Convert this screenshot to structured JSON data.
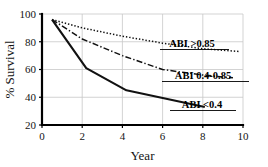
{
  "chart_data": {
    "type": "line",
    "title": "",
    "xlabel": "Year",
    "ylabel": "% Survival",
    "xlim": [
      0,
      10
    ],
    "ylim": [
      20,
      100
    ],
    "xticks": [
      0,
      2,
      4,
      6,
      8,
      10
    ],
    "yticks": [
      20,
      40,
      60,
      80,
      100
    ],
    "xtick_labels": [
      "0",
      "2",
      "4",
      "6",
      "8",
      "10"
    ],
    "ytick_labels": [
      "20",
      "40",
      "60",
      "80",
      "100"
    ],
    "grid": true,
    "legend_position": "inline-right",
    "series": [
      {
        "name": "ABI >0.85",
        "style": "dotted",
        "x": [
          0.5,
          2.0,
          4.0,
          6.0,
          8.0,
          9.8
        ],
        "values": [
          96,
          90,
          84,
          79,
          75,
          73
        ]
      },
      {
        "name": "ABI 0.4-0.85",
        "style": "dash-dot",
        "x": [
          0.5,
          2.0,
          4.0,
          6.0,
          8.0,
          9.5
        ],
        "values": [
          96,
          82,
          70,
          60,
          56,
          54
        ]
      },
      {
        "name": "ABI <0.4",
        "style": "solid",
        "x": [
          0.5,
          2.2,
          4.2,
          8.1
        ],
        "values": [
          96,
          61,
          45,
          33
        ]
      }
    ]
  },
  "axes": {
    "x_axis_title": "Year",
    "y_axis_title": "% Survival"
  },
  "annotations": [
    {
      "id": "label-abi-high",
      "text": "ABI >0.85"
    },
    {
      "id": "label-abi-mid",
      "text": "ABI 0.4-0.85"
    },
    {
      "id": "label-abi-low",
      "text": "ABI <0.4"
    }
  ],
  "colors": {
    "background": "#ffffff",
    "axis": "#000000",
    "grid": "#c8c8c8",
    "curve": "#111111",
    "text": "#141414"
  }
}
